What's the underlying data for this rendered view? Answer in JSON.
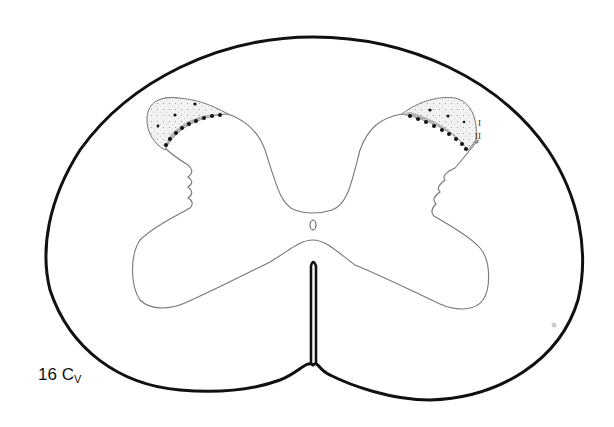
{
  "figure": {
    "caption_number": "16",
    "caption_segment": "C",
    "caption_subscript": "V",
    "lamina_labels": [
      "I",
      "II"
    ],
    "colors": {
      "outline": "#111111",
      "gray_matter_line": "#777777",
      "lamina_I_fill": "#ececec",
      "lamina_II_fill": "#b5b5b5",
      "dots": "#111111"
    }
  }
}
